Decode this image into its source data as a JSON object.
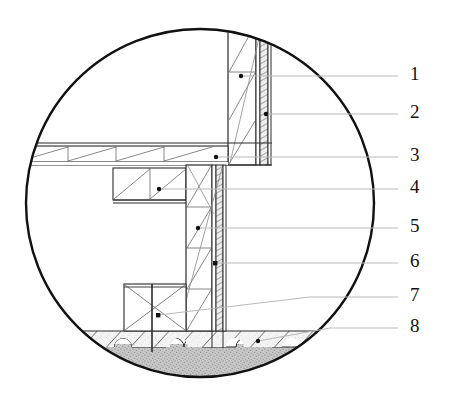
{
  "figure": {
    "kind": "architectural-cross-section-detail",
    "circle": {
      "cx": 200,
      "cy": 203,
      "r": 175
    },
    "colors": {
      "outline": "#111111",
      "line": "#2b2b2b",
      "hatch": "#555555",
      "leader": "#b8b8b8",
      "dot": "#111111",
      "screed_fill": "#f2f2f2",
      "ground_fill": "#c2c2c2",
      "insulation_fill": "#e8e8e8",
      "background": "#ffffff",
      "number": "#121212"
    }
  },
  "callouts": [
    {
      "id": "1",
      "label": "1",
      "text_x": 410,
      "text_y": 76,
      "line_x1": 241,
      "line_y1": 76,
      "line_x2": 398,
      "line_y2": 76,
      "dot_x": 241,
      "dot_y": 76
    },
    {
      "id": "2",
      "label": "2",
      "text_x": 410,
      "text_y": 114,
      "line_x1": 266,
      "line_y1": 114,
      "line_x2": 398,
      "line_y2": 114,
      "dot_x": 266,
      "dot_y": 114
    },
    {
      "id": "3",
      "label": "3",
      "text_x": 410,
      "text_y": 157,
      "line_x1": 216,
      "line_y1": 157,
      "line_x2": 398,
      "line_y2": 157,
      "dot_x": 216,
      "dot_y": 157
    },
    {
      "id": "4",
      "label": "4",
      "text_x": 410,
      "text_y": 189,
      "line_x1": 159,
      "line_y1": 189,
      "line_x2": 398,
      "line_y2": 189,
      "dot_x": 159,
      "dot_y": 189
    },
    {
      "id": "5",
      "label": "5",
      "text_x": 410,
      "text_y": 228,
      "line_x1": 198,
      "line_y1": 228,
      "line_x2": 398,
      "line_y2": 228,
      "dot_x": 198,
      "dot_y": 228
    },
    {
      "id": "6",
      "label": "6",
      "text_x": 410,
      "text_y": 263,
      "line_x1": 215,
      "line_y1": 263,
      "line_x2": 398,
      "line_y2": 263,
      "dot_x": 215,
      "dot_y": 263
    },
    {
      "id": "7",
      "label": "7",
      "text_x": 410,
      "text_y": 297,
      "line_x1": 158,
      "line_y1": 315,
      "line_x2": 398,
      "line_y2": 297,
      "dot_x": 158,
      "dot_y": 315
    },
    {
      "id": "8",
      "label": "8",
      "text_x": 410,
      "text_y": 328,
      "line_x1": 258,
      "line_y1": 341,
      "line_x2": 398,
      "line_y2": 328,
      "dot_x": 258,
      "dot_y": 341
    }
  ],
  "geometry": {
    "wall_upper": {
      "x": 228,
      "y": 28,
      "w": 28,
      "h": 137
    },
    "wall_upper_skin": {
      "x": 256,
      "y": 28,
      "w": 4,
      "h": 137
    },
    "wall_insulation_upper": {
      "x": 260,
      "y": 30,
      "w": 8,
      "h": 135
    },
    "wall_lower": {
      "x": 186,
      "y": 165,
      "w": 26,
      "h": 166
    },
    "wall_lower_skin": {
      "x": 212,
      "y": 165,
      "w": 4,
      "h": 166
    },
    "wall_lower_insulation": {
      "x": 216,
      "y": 165,
      "w": 7,
      "h": 166
    },
    "floor_slab": {
      "x": 38,
      "y": 143,
      "w": 190,
      "h": 22
    },
    "floor_slab_cells": 4,
    "beam": {
      "x": 113,
      "y": 174,
      "w": 73,
      "h": 28
    },
    "plinth": {
      "x": 124,
      "y": 284,
      "w": 62,
      "h": 47
    },
    "screed": {
      "y": 331,
      "h": 16
    },
    "ground": {
      "y": 347
    },
    "scallop_count": 5,
    "scallop_radius": 9
  }
}
